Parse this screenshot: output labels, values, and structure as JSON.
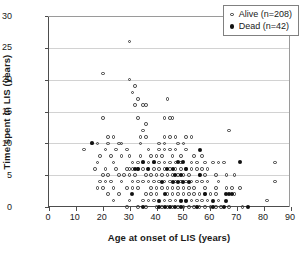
{
  "chart_data": {
    "type": "scatter",
    "title": "",
    "xlabel": "Age at onset of LIS (years)",
    "ylabel": "Time spent in LIS (years)",
    "xlim": [
      0,
      90
    ],
    "ylim": [
      0,
      30
    ],
    "xticks": [
      0,
      10,
      20,
      30,
      40,
      50,
      60,
      70,
      80,
      90
    ],
    "yticks": [
      0,
      5,
      10,
      15,
      20,
      25,
      30
    ],
    "grid": "horizontal",
    "legend_position": "top-right",
    "series": [
      {
        "name": "Alive (n=208)",
        "marker": "open-circle",
        "color": "#3a3a3a",
        "count": 208,
        "points": [
          [
            30,
            26
          ],
          [
            20,
            21
          ],
          [
            30,
            20
          ],
          [
            32,
            19
          ],
          [
            31,
            18
          ],
          [
            33,
            17
          ],
          [
            44,
            17
          ],
          [
            32,
            16
          ],
          [
            35,
            16
          ],
          [
            36,
            16
          ],
          [
            20,
            14
          ],
          [
            33,
            14
          ],
          [
            43,
            14
          ],
          [
            45,
            14
          ],
          [
            46,
            14
          ],
          [
            36,
            13
          ],
          [
            35,
            12
          ],
          [
            67,
            12
          ],
          [
            22,
            11
          ],
          [
            24,
            11
          ],
          [
            34,
            11
          ],
          [
            36,
            11
          ],
          [
            43,
            11
          ],
          [
            45,
            11
          ],
          [
            47,
            11
          ],
          [
            51,
            11
          ],
          [
            53,
            11
          ],
          [
            16,
            10
          ],
          [
            18,
            10
          ],
          [
            22,
            10
          ],
          [
            26,
            10
          ],
          [
            27,
            10
          ],
          [
            34,
            10
          ],
          [
            41,
            10
          ],
          [
            43,
            10
          ],
          [
            48,
            10
          ],
          [
            50,
            10
          ],
          [
            13,
            9
          ],
          [
            21,
            9
          ],
          [
            25,
            9
          ],
          [
            29,
            9
          ],
          [
            37,
            9
          ],
          [
            41,
            9
          ],
          [
            43,
            9
          ],
          [
            45,
            9
          ],
          [
            47,
            9
          ],
          [
            51,
            9
          ],
          [
            19,
            8
          ],
          [
            23,
            8
          ],
          [
            27,
            8
          ],
          [
            30,
            8
          ],
          [
            34,
            8
          ],
          [
            38,
            8
          ],
          [
            40,
            8
          ],
          [
            42,
            8
          ],
          [
            46,
            8
          ],
          [
            49,
            8
          ],
          [
            54,
            8
          ],
          [
            57,
            8
          ],
          [
            18,
            7
          ],
          [
            24,
            7
          ],
          [
            31,
            7
          ],
          [
            33,
            7
          ],
          [
            35,
            7
          ],
          [
            37,
            7
          ],
          [
            39,
            7
          ],
          [
            41,
            7
          ],
          [
            43,
            7
          ],
          [
            45,
            7
          ],
          [
            47,
            7
          ],
          [
            49,
            7
          ],
          [
            53,
            7
          ],
          [
            55,
            7
          ],
          [
            58,
            7
          ],
          [
            61,
            7
          ],
          [
            63,
            7
          ],
          [
            65,
            7
          ],
          [
            84,
            7
          ],
          [
            17,
            6
          ],
          [
            21,
            6
          ],
          [
            25,
            6
          ],
          [
            29,
            6
          ],
          [
            30,
            6
          ],
          [
            31,
            6
          ],
          [
            33,
            6
          ],
          [
            35,
            6
          ],
          [
            37,
            6
          ],
          [
            39,
            6
          ],
          [
            41,
            6
          ],
          [
            43,
            6
          ],
          [
            45,
            6
          ],
          [
            47,
            6
          ],
          [
            49,
            6
          ],
          [
            51,
            6
          ],
          [
            53,
            6
          ],
          [
            55,
            6
          ],
          [
            57,
            6
          ],
          [
            59,
            6
          ],
          [
            20,
            5
          ],
          [
            22,
            5
          ],
          [
            26,
            5
          ],
          [
            28,
            5
          ],
          [
            30,
            5
          ],
          [
            32,
            5
          ],
          [
            36,
            5
          ],
          [
            38,
            5
          ],
          [
            40,
            5
          ],
          [
            42,
            5
          ],
          [
            44,
            5
          ],
          [
            46,
            5
          ],
          [
            48,
            5
          ],
          [
            50,
            5
          ],
          [
            52,
            5
          ],
          [
            56,
            5
          ],
          [
            58,
            5
          ],
          [
            62,
            5
          ],
          [
            66,
            5
          ],
          [
            69,
            5
          ],
          [
            19,
            4
          ],
          [
            21,
            4
          ],
          [
            23,
            4
          ],
          [
            27,
            4
          ],
          [
            31,
            4
          ],
          [
            33,
            4
          ],
          [
            35,
            4
          ],
          [
            37,
            4
          ],
          [
            39,
            4
          ],
          [
            41,
            4
          ],
          [
            43,
            4
          ],
          [
            45,
            4
          ],
          [
            47,
            4
          ],
          [
            49,
            4
          ],
          [
            51,
            4
          ],
          [
            53,
            4
          ],
          [
            55,
            4
          ],
          [
            57,
            4
          ],
          [
            59,
            4
          ],
          [
            63,
            4
          ],
          [
            84,
            4
          ],
          [
            18,
            3
          ],
          [
            20,
            3
          ],
          [
            24,
            3
          ],
          [
            29,
            3
          ],
          [
            31,
            3
          ],
          [
            33,
            3
          ],
          [
            38,
            3
          ],
          [
            40,
            3
          ],
          [
            42,
            3
          ],
          [
            44,
            3
          ],
          [
            46,
            3
          ],
          [
            48,
            3
          ],
          [
            50,
            3
          ],
          [
            52,
            3
          ],
          [
            54,
            3
          ],
          [
            58,
            3
          ],
          [
            62,
            3
          ],
          [
            66,
            3
          ],
          [
            68,
            3
          ],
          [
            71,
            3
          ],
          [
            22,
            2
          ],
          [
            26,
            2
          ],
          [
            36,
            2
          ],
          [
            38,
            2
          ],
          [
            40,
            2
          ],
          [
            44,
            2
          ],
          [
            46,
            2
          ],
          [
            48,
            2
          ],
          [
            50,
            2
          ],
          [
            52,
            2
          ],
          [
            54,
            2
          ],
          [
            56,
            2
          ],
          [
            58,
            2
          ],
          [
            60,
            2
          ],
          [
            62,
            2
          ],
          [
            69,
            2
          ],
          [
            24,
            1
          ],
          [
            30,
            1
          ],
          [
            35,
            1
          ],
          [
            37,
            1
          ],
          [
            39,
            1
          ],
          [
            43,
            1
          ],
          [
            45,
            1
          ],
          [
            47,
            1
          ],
          [
            49,
            1
          ],
          [
            51,
            1
          ],
          [
            53,
            1
          ],
          [
            55,
            1
          ],
          [
            57,
            1
          ],
          [
            59,
            1
          ],
          [
            63,
            1
          ],
          [
            81,
            1
          ],
          [
            29,
            0
          ],
          [
            33,
            0
          ],
          [
            36,
            0
          ],
          [
            40,
            0
          ],
          [
            42,
            0
          ],
          [
            44,
            0
          ],
          [
            46,
            0
          ],
          [
            48,
            0
          ],
          [
            50,
            0
          ],
          [
            52,
            0
          ],
          [
            54,
            0
          ],
          [
            56,
            0
          ],
          [
            58,
            0
          ],
          [
            60,
            0
          ],
          [
            62,
            0
          ],
          [
            64,
            0
          ],
          [
            67,
            0
          ],
          [
            72,
            0
          ]
        ]
      },
      {
        "name": "Dead (n=42)",
        "marker": "filled-circle",
        "color": "#111111",
        "count": 42,
        "points": [
          [
            16,
            10
          ],
          [
            56,
            9
          ],
          [
            35,
            7
          ],
          [
            39,
            7
          ],
          [
            48,
            7
          ],
          [
            50,
            7
          ],
          [
            71,
            7
          ],
          [
            32,
            6
          ],
          [
            33,
            6
          ],
          [
            37,
            6
          ],
          [
            44,
            6
          ],
          [
            46,
            6
          ],
          [
            51,
            6
          ],
          [
            47,
            5
          ],
          [
            49,
            5
          ],
          [
            56,
            5
          ],
          [
            42,
            4
          ],
          [
            46,
            4
          ],
          [
            48,
            4
          ],
          [
            50,
            4
          ],
          [
            52,
            4
          ],
          [
            31,
            2
          ],
          [
            43,
            2
          ],
          [
            58,
            2
          ],
          [
            66,
            2
          ],
          [
            67,
            2
          ],
          [
            68,
            2
          ],
          [
            41,
            1
          ],
          [
            49,
            1
          ],
          [
            51,
            1
          ],
          [
            61,
            1
          ],
          [
            66,
            1
          ],
          [
            35,
            0
          ],
          [
            41,
            0
          ],
          [
            43,
            0
          ],
          [
            45,
            0
          ],
          [
            47,
            0
          ],
          [
            49,
            0
          ],
          [
            55,
            0
          ],
          [
            61,
            0
          ],
          [
            65,
            0
          ],
          [
            74,
            0
          ]
        ]
      }
    ]
  },
  "legend": {
    "items": [
      {
        "label": "Alive (n=208)"
      },
      {
        "label": "Dead (n=42)"
      }
    ]
  },
  "axes": {
    "x": {
      "title": "Age at onset of LIS (years)",
      "tick_labels": [
        "0",
        "10",
        "20",
        "30",
        "40",
        "50",
        "60",
        "70",
        "80",
        "90"
      ]
    },
    "y": {
      "title": "Time spent in LIS (years)",
      "tick_labels": [
        "0",
        "5",
        "10",
        "15",
        "20",
        "25",
        "30"
      ]
    }
  },
  "colors": {
    "alive_marker": "#3a3a3a",
    "dead_marker": "#111111",
    "gridline": "#d2d2d2",
    "axis": "#4d4d4d",
    "background": "#ffffff"
  }
}
